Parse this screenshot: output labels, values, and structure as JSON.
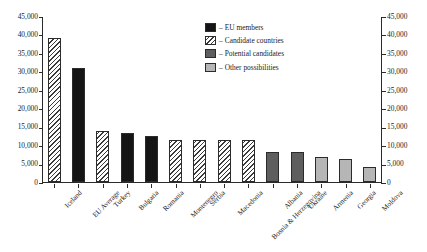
{
  "chart_data": {
    "type": "bar",
    "title": "",
    "xlabel": "",
    "ylabel": "",
    "ylim": [
      0,
      45000
    ],
    "ytick_step": 5000,
    "grid": false,
    "dual_axis": true,
    "legend_position": "top-right",
    "categories": [
      "Iceland",
      "EU Average",
      "Turkey",
      "Bulgaria",
      "Romania",
      "Montenegro",
      "Serbia",
      "Macedonia",
      "Bosnia & Herzegovina",
      "Albania",
      "Ukraine",
      "Armenia",
      "Georgia",
      "Moldova"
    ],
    "values": [
      39000,
      31000,
      13800,
      13200,
      12600,
      11400,
      11400,
      11300,
      11300,
      8200,
      8200,
      6700,
      6200,
      4200
    ],
    "groups": [
      "candidate",
      "eu",
      "candidate",
      "eu",
      "eu",
      "candidate",
      "candidate",
      "candidate",
      "candidate",
      "potential",
      "potential",
      "other",
      "other",
      "other"
    ],
    "ytick_labels": [
      "0",
      "5,000",
      "10,000",
      "15,000",
      "20,000",
      "25,000",
      "30,000",
      "35,000",
      "40,000",
      "45,000"
    ],
    "ytick_labels_right": [
      "0",
      "5,000",
      "10,000",
      "15,000",
      "20,000",
      "25,000",
      "30,000",
      "35,000",
      "40,000",
      "45,000"
    ],
    "legend": [
      {
        "label": "EU members",
        "key": "eu",
        "color": "#151515"
      },
      {
        "label": "Candidate countries",
        "key": "candidate",
        "color": "#ffffff"
      },
      {
        "label": "Potential candidates",
        "key": "potential",
        "color": "#5e5e5e"
      },
      {
        "label": "Other possibilities",
        "key": "other",
        "color": "#b6b6b6"
      }
    ],
    "legend_dash": "–"
  }
}
